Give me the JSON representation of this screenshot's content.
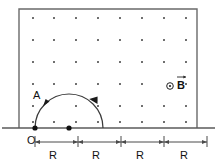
{
  "figure": {
    "colors": {
      "stroke": "#555555",
      "ink": "#111111",
      "field_dot": "#333333",
      "baseline": "#555555",
      "background": "#ffffff"
    },
    "field_region": {
      "name": "magnetic-field-region",
      "symbol": "dot-grid",
      "meaning": "field out of page",
      "dot_columns": 8,
      "dot_rows": 6,
      "box": {
        "x": 19,
        "y": 9,
        "width": 178,
        "height": 119
      }
    },
    "baseline": {
      "name": "horizontal-axis",
      "y": 128,
      "x_start": 2,
      "x_end": 215
    },
    "labels": {
      "origin": "O",
      "point_a": "A",
      "field": "B",
      "field_arrow": "→"
    },
    "field_marker": {
      "name": "field-out-of-page-symbol",
      "glyph": "⊙",
      "x": 170,
      "y": 86
    },
    "trajectory": {
      "name": "semicircular-path",
      "shape": "semicircle",
      "center_x": 69,
      "center_y": 128,
      "radius": 34,
      "direction": "counterclockwise",
      "arrowheads": 2
    },
    "points": [
      {
        "name": "origin-point",
        "label": "O",
        "x": 35,
        "y": 128
      },
      {
        "name": "center-point",
        "label": "",
        "x": 69,
        "y": 128
      }
    ],
    "dimensions": {
      "name": "distance-markings",
      "y_line": 143,
      "unit_label": "R",
      "segments": [
        {
          "label": "R",
          "x_start": 35,
          "x_end": 78
        },
        {
          "label": "R",
          "x_start": 78,
          "x_end": 121
        },
        {
          "label": "R",
          "x_start": 121,
          "x_end": 164
        },
        {
          "label": "R",
          "x_start": 164,
          "x_end": 207
        }
      ]
    }
  }
}
